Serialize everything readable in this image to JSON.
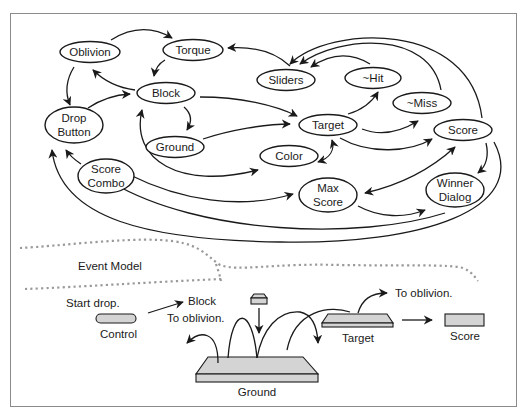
{
  "diagram": {
    "nodes": {
      "oblivion": "Oblivion",
      "torque": "Torque",
      "sliders": "Sliders",
      "hit": "~Hit",
      "block": "Block",
      "miss": "~Miss",
      "drop_button_1": "Drop",
      "drop_button_2": "Button",
      "target": "Target",
      "score": "Score",
      "ground": "Ground",
      "color": "Color",
      "score_combo_1": "Score",
      "score_combo_2": "Combo",
      "max_score_1": "Max",
      "max_score_2": "Score",
      "winner_dialog_1": "Winner",
      "winner_dialog_2": "Dialog"
    },
    "section_label": "Event Model",
    "event_model": {
      "start_drop": "Start drop.",
      "block": "Block",
      "to_oblivion_left": "To oblivion.",
      "control": "Control",
      "ground": "Ground",
      "target": "Target",
      "to_oblivion_right": "To oblivion.",
      "score": "Score"
    },
    "colors": {
      "stroke": "#1a1a1a",
      "fill_shape": "#d4d4d4",
      "dotted": "#9a9a9a",
      "frame": "#8a8a8a"
    }
  }
}
